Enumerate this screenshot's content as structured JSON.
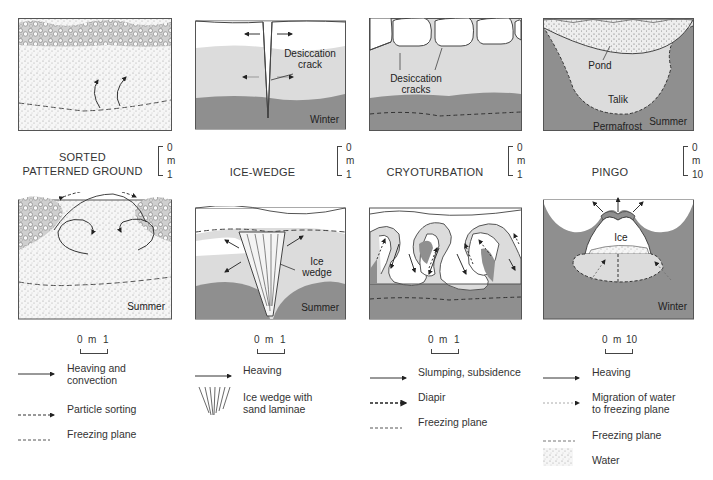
{
  "colors": {
    "light_gray": "#dcdcdc",
    "mid_gray": "#8f8f8f",
    "dark_gray": "#7d7d7d",
    "outline": "#555555",
    "white": "#ffffff"
  },
  "panels": [
    {
      "id": "sorted-patterned-ground",
      "title_line1": "SORTED",
      "title_line2": "PATTERNED GROUND",
      "vertical_scale": {
        "top": "0",
        "unit": "m",
        "bottom": "1"
      },
      "horizontal_scale": {
        "left": "0",
        "unit": "m",
        "right": "1"
      },
      "top_diagram": {
        "season": ""
      },
      "bottom_diagram": {
        "season": "Summer"
      }
    },
    {
      "id": "ice-wedge",
      "title_line1": "ICE-WEDGE",
      "vertical_scale": {
        "top": "0",
        "unit": "m",
        "bottom": "1"
      },
      "horizontal_scale": {
        "left": "0",
        "unit": "m",
        "right": "1"
      },
      "top_diagram": {
        "season": "Winter",
        "label": "Desiccation crack"
      },
      "bottom_diagram": {
        "season": "Summer",
        "label": "Ice wedge"
      }
    },
    {
      "id": "cryoturbation",
      "title_line1": "CRYOTURBATION",
      "vertical_scale": {
        "top": "0",
        "unit": "m",
        "bottom": "1"
      },
      "horizontal_scale": {
        "left": "0",
        "unit": "m",
        "right": "1"
      },
      "top_diagram": {
        "season": "",
        "label": "Desiccation cracks"
      },
      "bottom_diagram": {
        "season": ""
      }
    },
    {
      "id": "pingo",
      "title_line1": "PINGO",
      "vertical_scale": {
        "top": "0",
        "unit": "m",
        "bottom": "10"
      },
      "horizontal_scale": {
        "left": "0",
        "unit": "m",
        "right": "10"
      },
      "top_diagram": {
        "season": "Summer",
        "labels": [
          "Pond",
          "Talik",
          "Permafrost"
        ]
      },
      "bottom_diagram": {
        "season": "Winter",
        "label": "Ice"
      }
    }
  ],
  "legends": [
    {
      "panel": "sorted-patterned-ground",
      "items": [
        {
          "symbol": "solid-arrow",
          "text": "Heaving and convection"
        },
        {
          "symbol": "dashed-arrow",
          "text": "Particle sorting"
        },
        {
          "symbol": "dashed-line",
          "text": "Freezing plane"
        }
      ]
    },
    {
      "panel": "ice-wedge",
      "items": [
        {
          "symbol": "solid-arrow",
          "text": "Heaving"
        },
        {
          "symbol": "ice-wedge-laminae",
          "text": "Ice wedge with sand laminae"
        }
      ]
    },
    {
      "panel": "cryoturbation",
      "items": [
        {
          "symbol": "solid-arrow",
          "text": "Slumping, subsidence"
        },
        {
          "symbol": "bold-dashed-arrow",
          "text": "Diapir"
        },
        {
          "symbol": "dashed-line",
          "text": "Freezing plane"
        }
      ]
    },
    {
      "panel": "pingo",
      "items": [
        {
          "symbol": "solid-arrow",
          "text": "Heaving"
        },
        {
          "symbol": "dotted-arrow",
          "text": "Migration of water to freezing plane"
        },
        {
          "symbol": "dashed-line",
          "text": "Freezing plane"
        },
        {
          "symbol": "stipple-patch",
          "text": "Water"
        }
      ]
    }
  ],
  "ui": {
    "p1_title1": "SORTED",
    "p1_title2": "PATTERNED GROUND",
    "p2_title": "ICE-WEDGE",
    "p3_title": "CRYOTURBATION",
    "p4_title": "PINGO",
    "vs_zero": "0",
    "vs_m": "m",
    "vs_one": "1",
    "vs_ten": "10",
    "p1_bottom_season": "Summer",
    "p2_top_season": "Winter",
    "p2_bottom_season": "Summer",
    "p4_top_season": "Summer",
    "p4_bottom_season": "Winter",
    "p2_top_label1": "Desiccation",
    "p2_top_label2": "crack",
    "p2_bottom_label1": "Ice",
    "p2_bottom_label2": "wedge",
    "p3_top_label1": "Desiccation",
    "p3_top_label2": "cracks",
    "p4_pond": "Pond",
    "p4_talik": "Talik",
    "p4_permafrost": "Permafrost",
    "p4_ice": "Ice",
    "l1_a1": "Heaving and",
    "l1_a2": "convection",
    "l1_b": "Particle sorting",
    "l1_c": "Freezing plane",
    "l2_a": "Heaving",
    "l2_b1": "Ice wedge with",
    "l2_b2": "sand laminae",
    "l3_a": "Slumping, subsidence",
    "l3_b": "Diapir",
    "l3_c": "Freezing plane",
    "l4_a": "Heaving",
    "l4_b1": "Migration of water",
    "l4_b2": "to freezing plane",
    "l4_c": "Freezing plane",
    "l4_d": "Water"
  }
}
